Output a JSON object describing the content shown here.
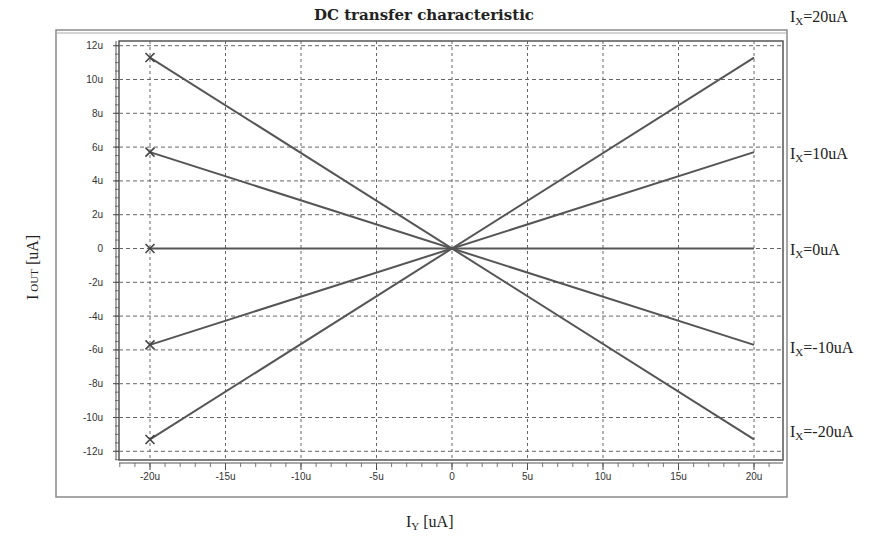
{
  "chart_data": {
    "type": "line",
    "title": "DC transfer characteristic",
    "xlabel": "I_Y [uA]",
    "xlabel_main": "I",
    "xlabel_sub": "Y",
    "xlabel_unit": " [uA]",
    "ylabel": "I_OUT [uA]",
    "ylabel_main": "I",
    "ylabel_sub": "OUT",
    "ylabel_unit": " [uA]",
    "xlim": [
      -22,
      22
    ],
    "ylim": [
      -12.5,
      12.5
    ],
    "grid": true,
    "x_ticks": [
      -20,
      -15,
      -10,
      -5,
      0,
      5,
      10,
      15,
      20
    ],
    "x_tick_labels": [
      "-20u",
      "-15u",
      "-10u",
      "-5u",
      "0",
      "5u",
      "10u",
      "15u",
      "20u"
    ],
    "y_ticks": [
      12,
      10,
      8,
      6,
      4,
      2,
      0,
      -2,
      -4,
      -6,
      -8,
      -10,
      -12
    ],
    "y_tick_labels": [
      "12u",
      "10u",
      "8u",
      "6u",
      "4u",
      "2u",
      "0",
      "-2u",
      "-4u",
      "-6u",
      "-8u",
      "-10u",
      "-12u"
    ],
    "x": [
      -20,
      20
    ],
    "series": [
      {
        "name": "IX=20uA",
        "label_main": "I",
        "label_sub": "X",
        "label_rest": "=20uA",
        "values": [
          11.3,
          11.3
        ],
        "endpoints": [
          [
            -20,
            11.3
          ],
          [
            0,
            0
          ],
          [
            20,
            11.3
          ]
        ],
        "marker_at_start": "x"
      },
      {
        "name": "IX=10uA",
        "label_main": "I",
        "label_sub": "X",
        "label_rest": "=10uA",
        "values": [
          5.7,
          5.7
        ],
        "endpoints": [
          [
            -20,
            5.7
          ],
          [
            0,
            0
          ],
          [
            20,
            5.7
          ]
        ],
        "marker_at_start": "x"
      },
      {
        "name": "IX=0uA",
        "label_main": "I",
        "label_sub": "X",
        "label_rest": "=0uA",
        "values": [
          0,
          0
        ],
        "endpoints": [
          [
            -20,
            0
          ],
          [
            0,
            0
          ],
          [
            20,
            0
          ]
        ],
        "marker_at_start": "x"
      },
      {
        "name": "IX=-10uA",
        "label_main": "I",
        "label_sub": "X",
        "label_rest": "=-10uA",
        "values": [
          -5.7,
          -5.7
        ],
        "endpoints": [
          [
            -20,
            -5.7
          ],
          [
            0,
            0
          ],
          [
            20,
            -5.7
          ]
        ],
        "marker_at_start": "x"
      },
      {
        "name": "IX=-20uA",
        "label_main": "I",
        "label_sub": "X",
        "label_rest": "=-20uA",
        "values": [
          -11.3,
          -11.3
        ],
        "endpoints": [
          [
            -20,
            -11.3
          ],
          [
            0,
            0
          ],
          [
            20,
            -11.3
          ]
        ],
        "marker_at_start": "x"
      }
    ],
    "line_pairs_note": "Lines cross through origin: left endpoints at -20u and right endpoints at +20u form X shapes",
    "segments": [
      {
        "from": [
          -20,
          11.3
        ],
        "to": [
          20,
          -11.3
        ]
      },
      {
        "from": [
          -20,
          5.7
        ],
        "to": [
          20,
          -5.7
        ]
      },
      {
        "from": [
          -20,
          0
        ],
        "to": [
          20,
          0
        ]
      },
      {
        "from": [
          -20,
          -5.7
        ],
        "to": [
          20,
          5.7
        ]
      },
      {
        "from": [
          -20,
          -11.3
        ],
        "to": [
          20,
          11.3
        ]
      }
    ],
    "colors": {
      "line": "#555555",
      "grid": "#666666",
      "frame": "#777777",
      "text": "#222222"
    }
  }
}
